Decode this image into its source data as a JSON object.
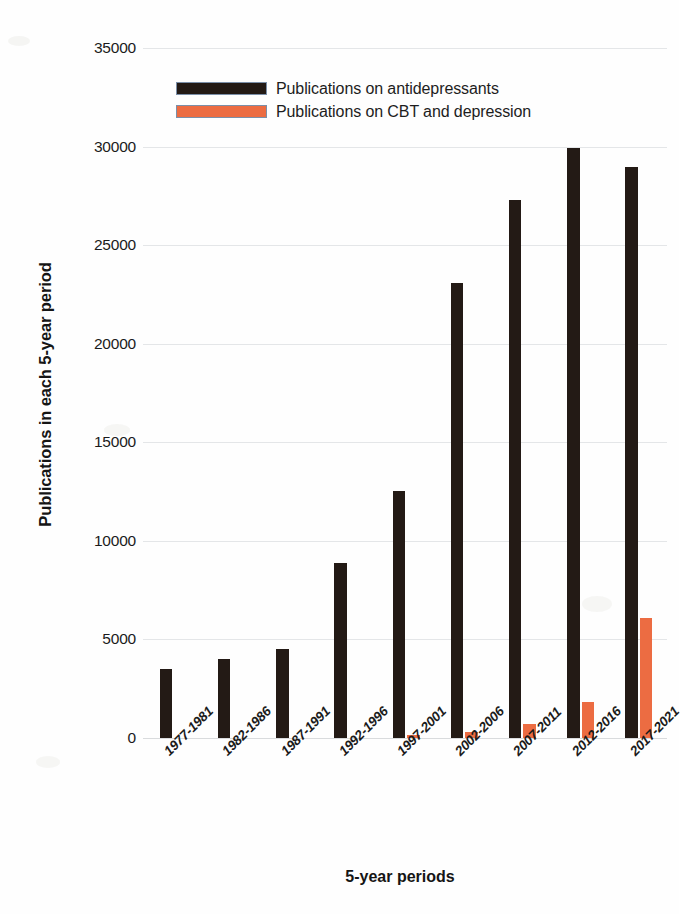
{
  "chart_data": {
    "type": "bar",
    "title": "",
    "xlabel": "5-year periods",
    "ylabel": "Publications in each 5-year period",
    "categories": [
      "1977-1981",
      "1982-1986",
      "1987-1991",
      "1992-1996",
      "1997-2001",
      "2002-2006",
      "2007-2011",
      "2012-2016",
      "2017-2021"
    ],
    "series": [
      {
        "name": "Publications on antidepressants",
        "color": "#231a15",
        "values": [
          3500,
          4000,
          4500,
          8900,
          12550,
          23100,
          27300,
          29950,
          28950
        ]
      },
      {
        "name": "Publications on CBT and depression",
        "color": "#ec6c42",
        "values": [
          0,
          0,
          0,
          0,
          150,
          330,
          700,
          1850,
          6100
        ]
      }
    ],
    "ylim": [
      0,
      35000
    ],
    "ytick_labels": [
      "35000",
      "30000",
      "25000",
      "20000",
      "15000",
      "10000",
      "5000",
      "0"
    ],
    "ytick_values": [
      35000,
      30000,
      25000,
      20000,
      15000,
      10000,
      5000,
      0
    ],
    "grid": true,
    "legend_position": "top-left-inside"
  },
  "legend": {
    "items": [
      {
        "label": "Publications on antidepressants",
        "swatch": "dark"
      },
      {
        "label": "Publications on CBT and depression",
        "swatch": "orange"
      }
    ]
  },
  "axes": {
    "y_title": "Publications in each 5-year period",
    "x_title": "5-year periods"
  }
}
